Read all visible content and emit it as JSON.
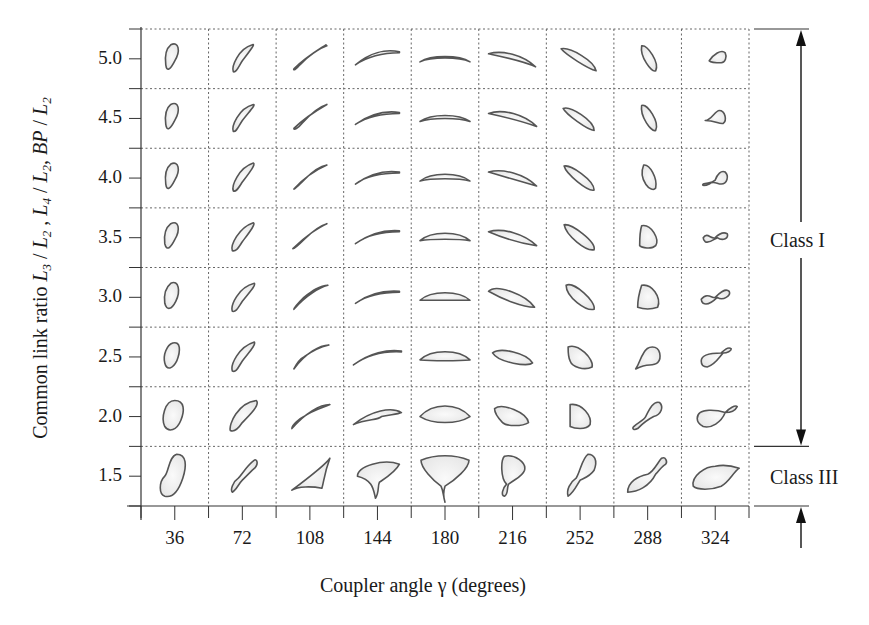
{
  "figure": {
    "xlabel": "Coupler angle γ (degrees)",
    "ylabel_parts": [
      {
        "t": "Common link ratio ",
        "i": false
      },
      {
        "t": "L",
        "i": true
      },
      {
        "t": "3",
        "sub": true
      },
      {
        "t": " / ",
        "i": false
      },
      {
        "t": "L",
        "i": true
      },
      {
        "t": "2",
        "sub": true
      },
      {
        "t": " , ",
        "i": false
      },
      {
        "t": "L",
        "i": true
      },
      {
        "t": "4",
        "sub": true
      },
      {
        "t": " / ",
        "i": false
      },
      {
        "t": "L",
        "i": true
      },
      {
        "t": "2",
        "sub": true
      },
      {
        "t": ", ",
        "i": false
      },
      {
        "t": "BP",
        "i": true
      },
      {
        "t": " / ",
        "i": false
      },
      {
        "t": "L",
        "i": true
      },
      {
        "t": "2",
        "sub": true
      }
    ],
    "ylabel_text": "Common link ratio L3 / L2 , L4 / L2, BP / L2",
    "x_ticks": [
      "36",
      "72",
      "108",
      "144",
      "180",
      "216",
      "252",
      "288",
      "324"
    ],
    "y_ticks": [
      "5.0",
      "4.5",
      "4.0",
      "3.5",
      "3.0",
      "2.5",
      "2.0",
      "1.5"
    ],
    "classes": [
      {
        "label": "Class I",
        "range": [
          "2.0",
          "5.0"
        ]
      },
      {
        "label": "Class III",
        "range": [
          "1.5",
          "1.5"
        ]
      }
    ],
    "colors": {
      "line": "#555555",
      "fill": "#e6e6e6",
      "grid": "#666666",
      "axis": "#333333"
    }
  },
  "chart_data": {
    "type": "table",
    "xlabel": "Coupler angle γ (degrees)",
    "ylabel": "Common link ratio L3/L2, L4/L2, BP/L2",
    "columns": [
      36,
      72,
      108,
      144,
      180,
      216,
      252,
      288,
      324
    ],
    "rows": [
      5.0,
      4.5,
      4.0,
      3.5,
      3.0,
      2.5,
      2.0,
      1.5
    ],
    "classification": {
      "Class I": [
        2.0,
        2.5,
        3.0,
        3.5,
        4.0,
        4.5,
        5.0
      ],
      "Class III": [
        1.5
      ]
    },
    "grid": true
  },
  "shapes": [
    [
      "M-4,-14 C4,-18 6,-8 0,2 C-4,10 -8,14 -9,6 C-10,-2 -9,-10 -4,-14 Z",
      "M10,-14 C14,-16 6,-6 0,2 C-4,8 -6,14 -9,13 C-11,8 -4,-10 10,-14 Z",
      "M16,-14 C10,-10 -4,-2 -16,10 C-17,12 -14,11 -10,6 C0,-4 8,-10 17,-13 Z",
      "M22,-7 C8,-10 -8,-6 -22,6 C-10,-2 6,-6 22,-6 Z",
      "M-25,3 C-14,-4 14,-4 25,3 C14,-2 -14,-2 -25,3 Z",
      "M-24,-5 C-10,-9 10,-4 23,8 C10,2 -10,-2 -24,-5 Z",
      "M-19,-10 C-10,-12 14,2 16,12 C8,10 -14,-4 -19,-10 Z",
      "M-6,-13 C0,-14 12,4 8,12 C4,14 -8,-2 -6,-13 Z",
      "M-6,2 C-2,-4 6,-10 10,-6 C12,-2 10,4 6,4 C2,4 -4,4 -6,2 Z"
    ],
    [
      "M-4,-14 C4,-18 6,-8 0,2 C-4,10 -8,14 -9,6 C-10,-2 -9,-10 -4,-14 Z",
      "M11,-14 C14,-14 6,-6 0,2 C-4,8 -6,14 -9,13 C-11,8 -4,-10 11,-14 Z",
      "M17,-14 C10,-10 -4,-2 -16,10 C-16,12 -12,10 -8,5 C2,-6 10,-12 17,-14 Z",
      "M22,-6 C8,-8 -8,-4 -22,6 C-10,-2 6,-5 22,-5 Z",
      "M-25,3 C-14,-5 14,-5 25,3 C14,-1 -14,-1 -25,3 Z",
      "M-24,-5 C-10,-10 12,-4 24,8 C10,3 -10,-2 -24,-5 Z",
      "M-17,-10 C-10,-13 14,2 14,12 C8,12 -14,-4 -17,-10 Z",
      "M-6,-13 C0,-15 12,4 8,12 C4,14 -8,-2 -6,-13 Z",
      "M-10,2 C-4,2 0,-8 4,-8 C10,-8 12,2 8,5 C4,6 0,2 -10,2 Z"
    ],
    [
      "M-4,-14 C4,-18 6,-8 0,2 C-4,10 -8,14 -9,6 C-10,-2 -9,-10 -4,-14 Z",
      "M11,-15 C14,-14 6,-4 0,4 C-4,10 -6,14 -9,13 C-11,8 -4,-10 11,-15 Z",
      "M17,-13 C10,-10 -4,-2 -16,11 C-16,12 -10,6 -6,2 C2,-6 10,-12 17,-13 Z",
      "M22,-6 C8,-8 -8,-4 -22,6 C-10,-3 6,-5 22,-5 Z",
      "M-25,3 C-14,-6 14,-6 25,3 C14,0 -14,0 -25,3 Z",
      "M-24,-6 C-10,-10 12,-4 24,8 C10,4 -10,-2 -24,-6 Z",
      "M-16,-12 C-10,-14 14,2 14,12 C8,14 -14,-4 -16,-12 Z",
      "M-4,-13 C2,-14 10,0 8,10 C4,16 -10,2 -4,-13 Z",
      "M-12,6 C-8,4 -4,6 0,2 C2,-4 6,-8 10,-6 C14,-2 12,6 6,6 C2,6 -2,2 -6,6 C-10,8 -14,8 -12,6 Z"
    ],
    [
      "M-4,-14 C4,-18 6,-8 0,2 C-4,10 -8,14 -10,6 C-11,-2 -9,-10 -4,-14 Z",
      "M11,-15 C14,-14 6,-4 0,4 C-4,10 -6,14 -10,13 C-12,8 -4,-10 11,-15 Z",
      "M17,-14 C10,-11 -4,-2 -17,11 C-16,12 -10,6 -6,2 C2,-6 10,-12 17,-14 Z",
      "M22,-7 C8,-8 -8,-4 -22,6 C-10,-3 6,-6 22,-6 Z",
      "M-25,3 C-14,-7 14,-7 25,3 C14,1 -14,1 -25,3 Z",
      "M-24,-6 C-10,-10 12,-4 24,8 C10,6 -10,0 -24,-6 Z",
      "M-16,-13 C-8,-14 16,4 14,12 C6,14 -14,-2 -16,-13 Z",
      "M-6,-12 C4,-14 12,2 8,8 C4,12 -6,10 -8,8 C-8,2 -8,-6 -6,-12 Z",
      "M-12,0 C-8,-6 -4,2 0,0 C4,-4 8,-6 12,-4 C14,0 8,4 2,0 C-2,2 -6,6 -10,4 C-12,2 -12,0 -12,0 Z"
    ],
    [
      "M-4,-14 C4,-18 6,-6 1,4 C-3,12 -8,14 -10,6 C-11,-2 -9,-10 -4,-14 Z",
      "M12,-14 C14,-12 6,-4 0,4 C-4,10 -6,15 -10,14 C-12,8 -4,-10 12,-14 Z",
      "M18,-12 C10,-10 -4,-2 -16,12 C-16,10 -10,4 -6,0 C2,-6 10,-12 18,-12 Z",
      "M22,-6 C8,-7 -8,-4 -22,6 C-10,-2 6,-5 22,-5 Z",
      "M-25,3 C-14,-7 14,-7 25,3 C14,3 -14,3 -25,3 Z",
      "M-24,-6 C-16,-14 14,-2 22,10 C10,10 -10,2 -24,-6 Z",
      "M-14,-12 C-6,-16 16,4 14,12 C6,14 -14,0 -14,-12 Z",
      "M-6,-12 C4,-14 14,0 10,10 C4,12 -4,12 -10,10 C-10,2 -8,-6 -6,-12 Z",
      "M-14,2 C-8,-6 -2,2 0,0 C4,-4 10,-10 14,-6 C16,-2 8,4 2,0 C-2,4 -8,8 -12,6 C-14,4 -14,2 -14,2 Z"
    ],
    [
      "M-2,-14 C6,-16 6,-6 2,4 C-2,12 -8,14 -10,6 C-12,-2 -8,-12 -2,-14 Z",
      "M12,-15 C14,-12 6,-4 0,4 C-4,10 -6,16 -10,14 C-12,8 -4,-10 12,-15 Z",
      "M19,-12 C10,-12 -4,-4 -16,12 C-14,8 -10,2 -6,0 C2,-6 10,-10 19,-12 Z",
      "M24,-6 C10,-8 -8,-4 -24,8 C-10,-2 6,-6 24,-5 Z",
      "M-25,3 C-14,-8 14,-8 25,3 C14,4 -14,4 -25,3 Z",
      "M-20,-4 C-12,-10 14,-4 20,6 C16,10 -14,6 -20,-4 Z",
      "M-12,-10 C-2,-14 14,2 12,10 C4,14 -8,10 -10,4 C-12,0 -12,-6 -12,-10 Z",
      "M-12,12 C-8,6 -8,2 -4,-4 C0,-12 10,-12 12,-4 C14,6 8,8 2,8 C-2,8 -8,10 -12,12 Z",
      "M-14,4 C-14,-4 0,-4 6,-4 C10,-8 14,-10 16,-8 C16,-6 12,-4 8,-4 C4,0 0,8 -8,10 C-12,10 -14,8 -14,4 Z"
    ],
    [
      "M0,-16 C10,-16 10,-6 6,4 C2,14 -6,16 -10,10 C-14,2 -10,-16 0,-16 Z",
      "M14,-16 C18,-12 8,-2 0,6 C-4,12 -8,16 -12,14 C-14,8 -4,-14 14,-16 Z",
      "M20,-12 C10,-12 -4,-4 -18,12 C-18,8 -10,2 -6,0 C2,-6 10,-8 20,-12 Z",
      "M24,-4 C14,-10 -6,-6 -24,8 C-10,2 0,4 4,0 C12,-2 20,-2 24,-4 Z",
      "M-25,0 C-12,-14 12,-14 25,0 C12,8 -12,8 -25,0 Z",
      "M-18,-8 C-10,-14 14,-4 16,6 C10,10 -6,10 -10,6 C-14,2 -18,-4 -18,-8 Z",
      "M-10,-12 C2,-14 12,0 10,8 C6,14 -6,12 -10,10 C-10,4 -10,-4 -10,-12 Z",
      "M-14,10 C-10,6 -4,4 -2,0 C2,-8 6,-16 12,-14 C16,-10 14,-2 6,0 C2,2 -4,6 -10,12 C-14,14 -16,12 -14,10 Z",
      "M-18,2 C-18,-10 4,-6 10,-4 C14,-8 20,-12 22,-10 C20,-6 16,-4 10,-4 C6,6 -4,12 -12,10 C-16,8 -18,6 -18,2 Z"
    ],
    [
      "M2,-22 C12,-22 12,-10 8,2 C4,14 -2,22 -10,20 C-16,18 -16,6 -10,0 C-6,-4 -6,-20 2,-22 Z",
      "M12,-16 C14,-18 18,-12 10,-6 C6,-2 2,2 0,4 C-4,8 -6,14 -10,16 C-12,14 -10,6 -4,2 C0,-2 4,-10 12,-16 Z",
      "M20,-18 C16,-12 -10,8 -18,14 C-12,10 2,10 12,12 C14,6 14,-2 20,-18 Z",
      "M-20,0 C-20,-10 6,-18 22,-12 C18,-4 8,2 2,6 C0,10 2,16 -2,22 C-4,14 -4,4 -20,0 Z",
      "M-24,-16 C-10,-22 10,-22 24,-16 C24,-8 10,4 0,10 C-2,16 -2,20 0,26 C-2,18 -2,14 -4,10 C-12,4 -24,-8 -24,-16 Z",
      "M-8,-20 C2,-22 14,-14 12,-6 C10,0 4,2 -4,8 C-6,12 -4,18 -8,20 C-12,20 -10,12 -6,8 C-12,2 -12,-16 -8,-20 Z",
      "M8,-22 C14,-22 18,-16 14,-6 C10,0 4,2 0,4 C-4,10 -6,16 -12,20 C-14,14 -10,6 -4,2 C0,-4 2,-18 8,-22 Z",
      "M-20,16 C-20,6 -10,0 0,-2 C6,-4 10,-14 14,-18 C18,-20 20,-14 18,-12 C14,-10 12,-6 8,-2 C2,10 -10,16 -20,16 Z",
      "M-22,10 C-24,0 -10,-10 0,-10 C10,-12 18,-10 24,-8 C18,-4 14,6 6,10 C-4,14 -18,14 -22,10 Z"
    ]
  ]
}
